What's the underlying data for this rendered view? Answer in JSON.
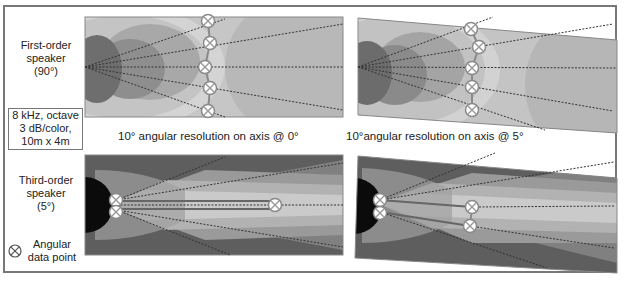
{
  "labels": {
    "first_order": [
      "First-order",
      "speaker",
      "(90°)"
    ],
    "params": [
      "8 kHz, octave",
      "3 dB/color,",
      "10m x 4m"
    ],
    "third_order": [
      "Third-order",
      "speaker",
      "(5°)"
    ],
    "legend": [
      "Angular",
      "data point"
    ]
  },
  "captions": {
    "axis0": "10° angular resolution on axis @ 0°",
    "axis5": "10°angular resolution on axis @ 5°"
  },
  "legend_icon": "crossed-circle-icon",
  "colors": {
    "frame": "#777777",
    "marker_fill": "#ffffff",
    "marker_stroke": "#8a8a8a",
    "chain": "#8a8a8a",
    "ray": "#333333"
  },
  "panels": [
    {
      "id": "first-order-0deg",
      "tilt": 0,
      "markers": 5
    },
    {
      "id": "first-order-5deg",
      "tilt": 5,
      "markers": 5
    },
    {
      "id": "third-order-0deg",
      "tilt": 0,
      "markers": 3
    },
    {
      "id": "third-order-5deg",
      "tilt": 5,
      "markers": 4
    }
  ]
}
